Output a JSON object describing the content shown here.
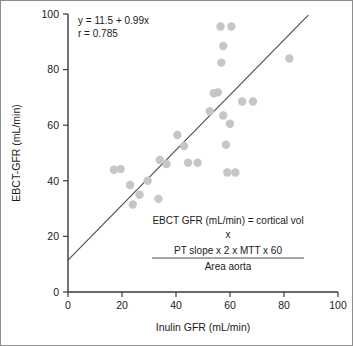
{
  "chart_data": {
    "type": "scatter",
    "title": "",
    "xlabel": "Inulin GFR (mL/min)",
    "ylabel": "EBCT-GFR (mL/min)",
    "xlim": [
      0,
      100
    ],
    "ylim": [
      0,
      100
    ],
    "xticks": [
      0,
      20,
      40,
      60,
      80,
      100
    ],
    "yticks": [
      0,
      20,
      40,
      60,
      80,
      100
    ],
    "grid": false,
    "legend": "none",
    "marker_color": "#c6c6c6",
    "line_color": "#4a4a4a",
    "points": [
      {
        "x": 17.0,
        "y": 44.0
      },
      {
        "x": 19.5,
        "y": 44.2
      },
      {
        "x": 23.0,
        "y": 38.5
      },
      {
        "x": 24.0,
        "y": 31.5
      },
      {
        "x": 26.5,
        "y": 35.0
      },
      {
        "x": 29.5,
        "y": 40.0
      },
      {
        "x": 33.5,
        "y": 33.5
      },
      {
        "x": 34.0,
        "y": 47.5
      },
      {
        "x": 36.5,
        "y": 46.0
      },
      {
        "x": 40.5,
        "y": 56.5
      },
      {
        "x": 43.0,
        "y": 52.5
      },
      {
        "x": 44.5,
        "y": 46.5
      },
      {
        "x": 48.0,
        "y": 46.5
      },
      {
        "x": 52.5,
        "y": 65.0
      },
      {
        "x": 54.0,
        "y": 71.5
      },
      {
        "x": 55.5,
        "y": 71.8
      },
      {
        "x": 56.5,
        "y": 95.5
      },
      {
        "x": 57.5,
        "y": 88.5
      },
      {
        "x": 56.8,
        "y": 82.5
      },
      {
        "x": 57.5,
        "y": 63.5
      },
      {
        "x": 58.5,
        "y": 53.0
      },
      {
        "x": 59.0,
        "y": 43.0
      },
      {
        "x": 60.5,
        "y": 95.5
      },
      {
        "x": 60.0,
        "y": 60.5
      },
      {
        "x": 62.0,
        "y": 43.0
      },
      {
        "x": 64.5,
        "y": 68.5
      },
      {
        "x": 68.5,
        "y": 68.5
      },
      {
        "x": 82.0,
        "y": 84.0
      }
    ],
    "regression": {
      "equation": "y = 11.5 + 0.99x",
      "correlation": "r = 0.785",
      "intercept": 11.5,
      "slope": 0.99,
      "r": 0.785,
      "x_start": 0,
      "x_end": 89
    },
    "annotations": {
      "formula_line1": "EBCT GFR (mL/min) = cortical vol",
      "formula_line2": "x",
      "formula_numerator": "PT slope x 2 x MTT x 60",
      "formula_denominator": "Area aorta"
    }
  }
}
